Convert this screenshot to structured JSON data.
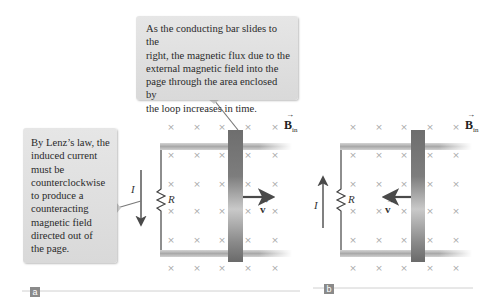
{
  "callouts": {
    "top": "As the conducting bar slides to the\nright, the magnetic flux due to the\nexternal magnetic field into the\npage through the area enclosed by\nthe loop increases in time.",
    "left": "By Lenz’s law, the\ninduced current\nmust be\ncounterclockwise\nto produce a\ncounteracting\nmagnetic field\ndirected out of\nthe page."
  },
  "panels": [
    {
      "tag": "a",
      "current_label": "I",
      "resistor_label": "R",
      "velocity_label": "v",
      "field_label": "B",
      "field_subscript": "in",
      "velocity_direction": "right",
      "current_direction": "down"
    },
    {
      "tag": "b",
      "current_label": "I",
      "resistor_label": "R",
      "velocity_label": "v",
      "field_label": "B",
      "field_subscript": "in",
      "velocity_direction": "left",
      "current_direction": "up"
    }
  ],
  "field_marker": "×",
  "colors": {
    "callout_bg": "#dcdcdc",
    "x_marks": "#a8a8a8",
    "bar": "#7a7a7a",
    "rail": "#bdbdbd",
    "wire": "#444444",
    "arrow": "#555555"
  }
}
